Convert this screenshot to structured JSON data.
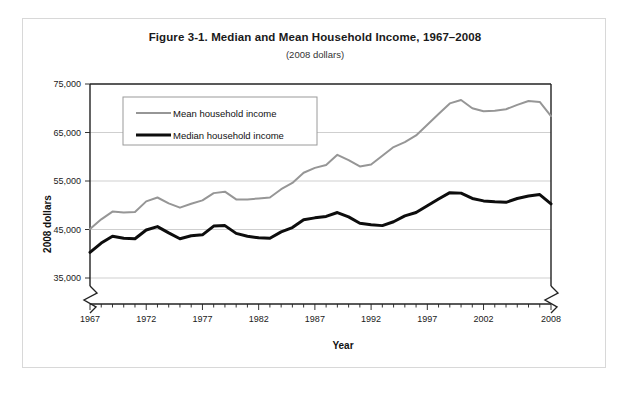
{
  "figure": {
    "title": "Figure 3-1. Median and Mean Household Income, 1967–2008",
    "subtitle": "(2008 dollars)"
  },
  "chart_data": {
    "type": "line",
    "title": "Figure 3-1. Median and Mean Household Income, 1967–2008",
    "subtitle": "(2008 dollars)",
    "xlabel": "Year",
    "ylabel": "2008 dollars",
    "xlim": [
      1967,
      2008
    ],
    "ylim": [
      35000,
      75000
    ],
    "ytick_labels": [
      "75,000",
      "65,000",
      "55,000",
      "45,000",
      "35,000"
    ],
    "ytick_values": [
      75000,
      65000,
      55000,
      45000,
      35000
    ],
    "xtick_labels": [
      "1967",
      "1972",
      "1977",
      "1982",
      "1987",
      "1992",
      "1997",
      "2002",
      "2008"
    ],
    "xtick_values": [
      1967,
      1972,
      1977,
      1982,
      1987,
      1992,
      1997,
      2002,
      2008
    ],
    "xtick_minor_step": 1,
    "grid": "horizontal",
    "axis_break_x": true,
    "axis_break_y": true,
    "legend_position": "top-left-inside",
    "x": [
      1967,
      1968,
      1969,
      1970,
      1971,
      1972,
      1973,
      1974,
      1975,
      1976,
      1977,
      1978,
      1979,
      1980,
      1981,
      1982,
      1983,
      1984,
      1985,
      1986,
      1987,
      1988,
      1989,
      1990,
      1991,
      1992,
      1993,
      1994,
      1995,
      1996,
      1997,
      1998,
      1999,
      2000,
      2001,
      2002,
      2003,
      2004,
      2005,
      2006,
      2007,
      2008
    ],
    "series": [
      {
        "name": "Mean household income",
        "color": "#969696",
        "width": 2,
        "values": [
          45100,
          47100,
          48700,
          48500,
          48600,
          50800,
          51600,
          50400,
          49500,
          50300,
          51000,
          52500,
          52800,
          51200,
          51200,
          51400,
          51600,
          53300,
          54600,
          56700,
          57700,
          58300,
          60400,
          59300,
          58000,
          58400,
          60200,
          62000,
          63000,
          64400,
          66600,
          68800,
          71000,
          71700,
          70000,
          69400,
          69500,
          69800,
          70700,
          71500,
          71300,
          68400
        ]
      },
      {
        "name": "Median household income",
        "color": "#0d0d0d",
        "width": 3,
        "values": [
          40300,
          42200,
          43600,
          43200,
          43100,
          44900,
          45600,
          44300,
          43100,
          43700,
          43900,
          45700,
          45800,
          44200,
          43600,
          43300,
          43200,
          44500,
          45400,
          47000,
          47400,
          47700,
          48500,
          47600,
          46300,
          46000,
          45800,
          46600,
          47800,
          48500,
          49900,
          51300,
          52600,
          52500,
          51400,
          50900,
          50700,
          50600,
          51400,
          51900,
          52200,
          50300
        ]
      }
    ]
  },
  "legend": {
    "items": [
      {
        "label": "Mean household income",
        "color": "#969696"
      },
      {
        "label": "Median household income",
        "color": "#0d0d0d"
      }
    ]
  }
}
